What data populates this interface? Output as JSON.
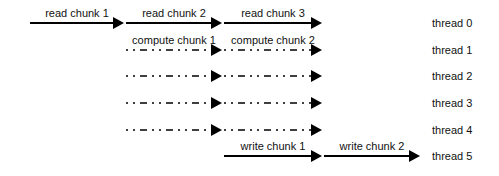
{
  "diagram": {
    "title": "",
    "line_color": "#000000",
    "threads": [
      {
        "label": "thread 0",
        "style": "solid",
        "start_x": 30,
        "segments": [
          {
            "label": "read chunk 1",
            "end_x": 124
          },
          {
            "label": "read chunk 2",
            "end_x": 222
          },
          {
            "label": "read chunk 3",
            "end_x": 322
          }
        ]
      },
      {
        "label": "thread 1",
        "style": "dashdot",
        "start_x": 126,
        "segments": [
          {
            "label": "compute chunk 1",
            "end_x": 222
          },
          {
            "label": "compute chunk 2",
            "end_x": 322
          }
        ]
      },
      {
        "label": "thread 2",
        "style": "dashdot",
        "start_x": 126,
        "segments": [
          {
            "label": "",
            "end_x": 222
          },
          {
            "label": "",
            "end_x": 322
          }
        ]
      },
      {
        "label": "thread 3",
        "style": "dashdot",
        "start_x": 126,
        "segments": [
          {
            "label": "",
            "end_x": 222
          },
          {
            "label": "",
            "end_x": 322
          }
        ]
      },
      {
        "label": "thread 4",
        "style": "dashdot",
        "start_x": 126,
        "segments": [
          {
            "label": "",
            "end_x": 222
          },
          {
            "label": "",
            "end_x": 322
          }
        ]
      },
      {
        "label": "thread 5",
        "style": "solid",
        "start_x": 224,
        "segments": [
          {
            "label": "write chunk 1",
            "end_x": 322
          },
          {
            "label": "write chunk 2",
            "end_x": 420
          }
        ]
      }
    ]
  }
}
